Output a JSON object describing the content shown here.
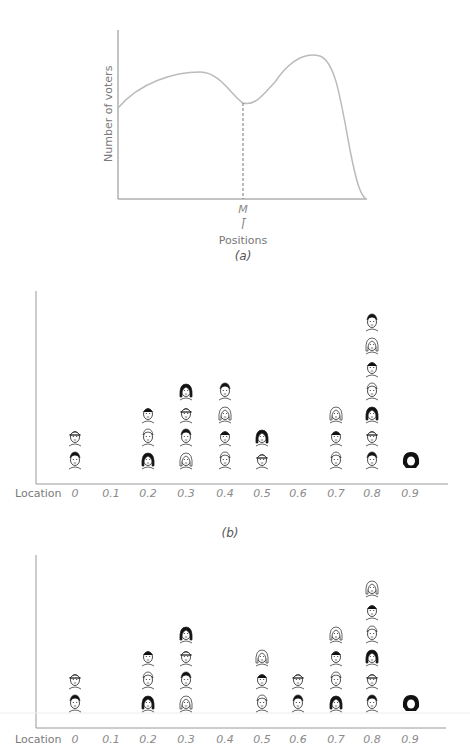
{
  "chart_data": [
    {
      "type": "line",
      "panel": "(a)",
      "title": "",
      "xlabel": "Positions",
      "ylabel": "Number of voters",
      "x_marker_label": "M",
      "x_marker_sub": "l̄",
      "description": "Bimodal voter distribution with median M at the dip between two peaks; left peak lower, right peak higher",
      "x": [
        0,
        0.1,
        0.2,
        0.3,
        0.4,
        0.5,
        0.6,
        0.7,
        0.8,
        0.9,
        1.0
      ],
      "values": [
        0.55,
        0.68,
        0.74,
        0.74,
        0.65,
        0.56,
        0.66,
        0.82,
        0.78,
        0.35,
        0.0
      ],
      "grid": false
    },
    {
      "type": "scatter",
      "panel": "(b)",
      "xlabel": "Location",
      "categories": [
        "0",
        "0.1",
        "0.2",
        "0.3",
        "0.4",
        "0.5",
        "0.6",
        "0.7",
        "0.8",
        "0.9"
      ],
      "values": [
        2,
        0,
        3,
        4,
        4,
        2,
        0,
        3,
        7,
        1
      ],
      "description": "Pictograph: each face icon represents one voter at a location"
    },
    {
      "type": "scatter",
      "panel": "(c)",
      "xlabel": "Location",
      "categories": [
        "0",
        "0.1",
        "0.2",
        "0.3",
        "0.4",
        "0.5",
        "0.6",
        "0.7",
        "0.8",
        "0.9"
      ],
      "values": [
        2,
        0,
        3,
        4,
        0,
        3,
        2,
        4,
        6,
        1
      ],
      "description": "Pictograph: each face icon represents one voter at a location"
    }
  ],
  "panel_a": {
    "ylabel": "Number of voters",
    "marker": "M",
    "marker_sub": "l̄",
    "xlabel": "Positions",
    "caption": "(a)"
  },
  "panel_b": {
    "axis_label": "Location",
    "ticks": [
      "0",
      "0.1",
      "0.2",
      "0.3",
      "0.4",
      "0.5",
      "0.6",
      "0.7",
      "0.8",
      "0.9"
    ],
    "caption": "(b)"
  },
  "panel_c": {
    "axis_label": "Location",
    "ticks": [
      "0",
      "0.1",
      "0.2",
      "0.3",
      "0.4",
      "0.5",
      "0.6",
      "0.7",
      "0.8",
      "0.9"
    ]
  }
}
